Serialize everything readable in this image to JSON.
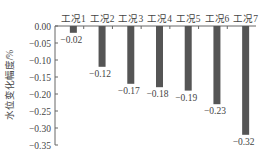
{
  "chart_data": {
    "type": "bar",
    "title": "",
    "xlabel": "",
    "ylabel": "水位变化幅度/%",
    "categories": [
      "工况1",
      "工况2",
      "工况3",
      "工况4",
      "工况5",
      "工况6",
      "工况7"
    ],
    "values": [
      -0.02,
      -0.12,
      -0.17,
      -0.18,
      -0.19,
      -0.23,
      -0.32
    ],
    "value_labels": [
      "-0.02",
      "-0.12",
      "-0.17",
      "-0.18",
      "-0.19",
      "-0.23",
      "-0.32"
    ],
    "ylim": [
      -0.35,
      0.0
    ],
    "yticks": [
      0.0,
      -0.05,
      -0.1,
      -0.15,
      -0.2,
      -0.25,
      -0.3,
      -0.35
    ],
    "ytick_labels": [
      "0.00",
      "-0.05",
      "-0.10",
      "-0.15",
      "-0.20",
      "-0.25",
      "-0.30",
      "-0.35"
    ],
    "category_axis_position": "top",
    "grid": false,
    "legend": null,
    "bar_color": "#555555"
  }
}
